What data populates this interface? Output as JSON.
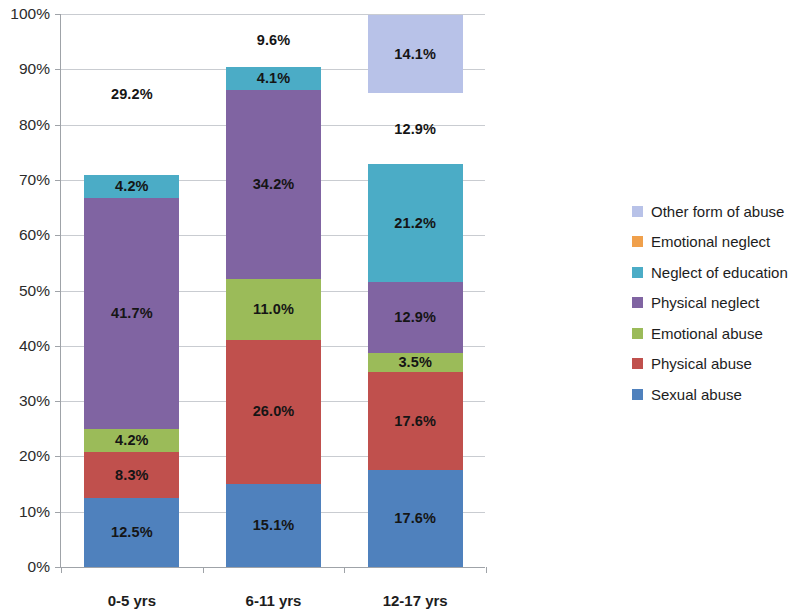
{
  "chart_data": {
    "type": "bar",
    "subtype": "stacked-100-percent",
    "title": "",
    "xlabel": "",
    "ylabel": "",
    "ylim": [
      0,
      100
    ],
    "ytick_labels": [
      "0%",
      "10%",
      "20%",
      "30%",
      "40%",
      "50%",
      "60%",
      "70%",
      "80%",
      "90%",
      "100%"
    ],
    "ytick_values": [
      0,
      10,
      20,
      30,
      40,
      50,
      60,
      70,
      80,
      90,
      100
    ],
    "grid": true,
    "legend_position": "right",
    "categories": [
      "0-5 yrs",
      "6-11 yrs",
      "12-17 yrs"
    ],
    "series": [
      {
        "name": "Sexual abuse",
        "color": "#4F81BD",
        "values": [
          12.5,
          15.1,
          17.6
        ],
        "labels": [
          "12.5%",
          "15.1%",
          "17.6%"
        ]
      },
      {
        "name": "Physical abuse",
        "color": "#C0504D",
        "values": [
          8.3,
          26.0,
          17.6
        ],
        "labels": [
          "8.3%",
          "26.0%",
          "17.6%"
        ]
      },
      {
        "name": "Emotional abuse",
        "color": "#9BBB59",
        "values": [
          4.2,
          11.0,
          3.5
        ],
        "labels": [
          "4.2%",
          "11.0%",
          "3.5%"
        ]
      },
      {
        "name": "Physical neglect",
        "color": "#8064A2",
        "values": [
          41.7,
          34.2,
          12.9
        ],
        "labels": [
          "41.7%",
          "34.2%",
          "12.9%"
        ]
      },
      {
        "name": "Neglect of education",
        "color": "#4BACC6",
        "values": [
          4.2,
          4.1,
          21.2
        ],
        "labels": [
          "4.2%",
          "4.1%",
          "21.2%"
        ]
      },
      {
        "name": "Emotional neglect",
        "color": "#F0A martin",
        "values": [
          29.2,
          9.6,
          12.9
        ],
        "labels": [
          "29.2%",
          "9.6%",
          "12.9%"
        ]
      },
      {
        "name": "Other form of abuse",
        "color": "#B8C2E8",
        "values": [
          0,
          0,
          14.1
        ],
        "labels": [
          "",
          "",
          "14.1%"
        ]
      }
    ],
    "legend_entries": [
      {
        "label": "Other form of abuse",
        "color": "#B8C2E8"
      },
      {
        "label": "Emotional neglect",
        "color": "#F0A04B"
      },
      {
        "label": "Neglect of education",
        "color": "#4BACC6"
      },
      {
        "label": "Physical neglect",
        "color": "#8064A2"
      },
      {
        "label": "Emotional abuse",
        "color": "#9BBB59"
      },
      {
        "label": "Physical abuse",
        "color": "#C0504D"
      },
      {
        "label": "Sexual abuse",
        "color": "#4F81BD"
      }
    ]
  }
}
